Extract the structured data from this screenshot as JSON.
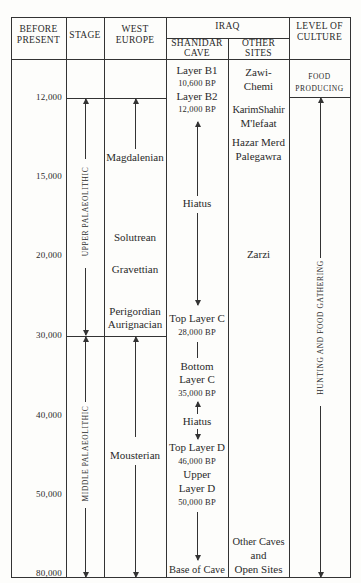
{
  "header": {
    "before_present": [
      "BEFORE",
      "PRESENT"
    ],
    "stage": "STAGE",
    "west_europe": [
      "WEST",
      "EUROPE"
    ],
    "iraq": "IRAQ",
    "shanidar_cave": [
      "SHANIDAR",
      "CAVE"
    ],
    "other_sites": [
      "OTHER",
      "SITES"
    ],
    "level_of_culture": [
      "LEVEL OF",
      "CULTURE"
    ]
  },
  "time_ticks": [
    {
      "label": "12,000",
      "y": 98
    },
    {
      "label": "15,000",
      "y": 177
    },
    {
      "label": "20,000",
      "y": 256
    },
    {
      "label": "30,000",
      "y": 336
    },
    {
      "label": "40,000",
      "y": 416
    },
    {
      "label": "50,000",
      "y": 495
    },
    {
      "label": "80,000",
      "y": 574
    }
  ],
  "stages": [
    {
      "label": "UPPER PALAEOLITHIC"
    },
    {
      "label": "MIDDLE PALAEOLITHIC"
    }
  ],
  "west_europe": {
    "magdalenian": "Magdalenian",
    "solutrean": "Solutrean",
    "gravettian": "Gravettian",
    "perigordian": "Perigordian",
    "aurignacian": "Aurignacian",
    "mousterian": "Mousterian"
  },
  "shanidar": {
    "layer_b1": "Layer B1",
    "layer_b1_date": "10,600 BP",
    "layer_b2": "Layer B2",
    "layer_b2_date": "12,000 BP",
    "hiatus1": "Hiatus",
    "top_layer_c": "Top Layer C",
    "top_layer_c_date": "28,000 BP",
    "bottom_layer_c_1": "Bottom",
    "bottom_layer_c_2": "Layer C",
    "bottom_layer_c_date": "35,000 BP",
    "hiatus2": "Hiatus",
    "top_layer_d": "Top Layer D",
    "top_layer_d_date": "46,000 BP",
    "upper_layer_d_1": "Upper",
    "upper_layer_d_2": "Layer D",
    "upper_layer_d_date": "50,000 BP",
    "base_of_cave": "Base of Cave"
  },
  "other_sites": {
    "zawi_chemi_1": "Zawi-",
    "zawi_chemi_2": "Chemi",
    "karim_shahir": "KarimShahir",
    "mlefaat": "M'lefaat",
    "hazar_merd": "Hazar Merd",
    "palegawra": "Palegawra",
    "zarzi": "Zarzi",
    "other_caves_1": "Other Caves",
    "other_caves_2": "and",
    "other_caves_3": "Open Sites"
  },
  "culture": {
    "food_producing_1": "FOOD",
    "food_producing_2": "PRODUCING",
    "hunting": "HUNTING AND FOOD GATHERING"
  }
}
